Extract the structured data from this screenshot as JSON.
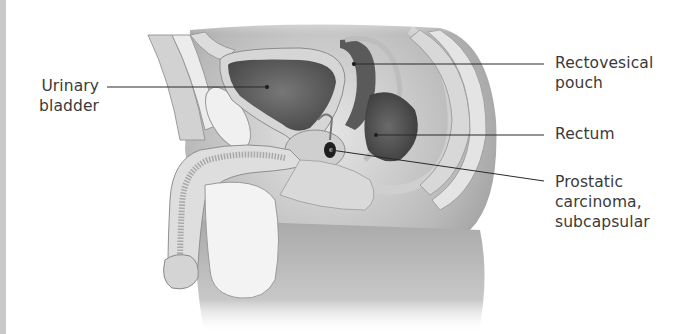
{
  "figure": {
    "type": "sagittal section anatomical illustration",
    "labels": {
      "urinary_bladder": {
        "line1": "Urinary",
        "line2": "bladder"
      },
      "rectovesical_pouch": {
        "line1": "Rectovesical",
        "line2": "pouch"
      },
      "rectum": {
        "line1": "Rectum"
      },
      "prostatic_carcinoma": {
        "line1": "Prostatic",
        "line2": "carcinoma,",
        "line3": "subcapsular"
      }
    },
    "colors": {
      "text": "#3a3a3a",
      "leader_line": "#2a2a2a",
      "side_bar": "#c9c9c9"
    }
  }
}
